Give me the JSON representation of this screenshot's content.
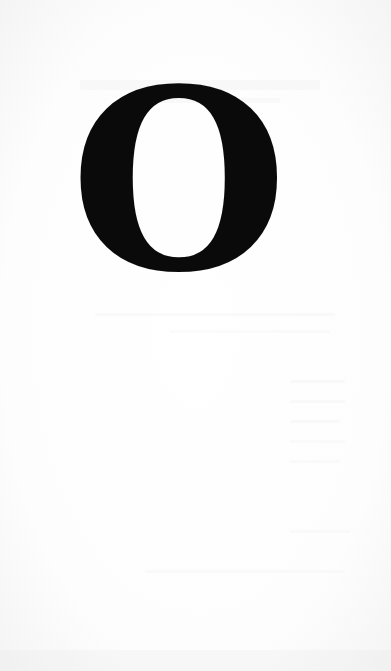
{
  "page": {
    "drop_cap": {
      "letter": "O",
      "color": "#0a0a0a"
    },
    "background_color": "#ffffff"
  }
}
